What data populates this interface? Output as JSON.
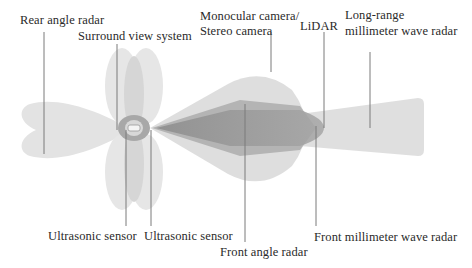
{
  "diagram": {
    "labels": {
      "rear_angle_radar": "Rear angle radar",
      "surround_view_system": "Surround view system",
      "monocular_camera_line1": "Monocular camera/",
      "monocular_camera_line2": "Stereo camera",
      "lidar": "LiDAR",
      "long_range_radar_line1": "Long-range",
      "long_range_radar_line2": "millimeter wave radar",
      "ultrasonic_sensor_left": "Ultrasonic sensor",
      "ultrasonic_sensor_right": "Ultrasonic sensor",
      "front_angle_radar": "Front angle radar",
      "front_mmwave_radar": "Front millimeter wave radar"
    },
    "colors": {
      "zone_light": "#e6e6e6",
      "zone_mid": "#d2d2d2",
      "zone_dark": "#9a9a9a",
      "leader_line": "#7a7a7a",
      "text": "#2a2a2a"
    }
  }
}
